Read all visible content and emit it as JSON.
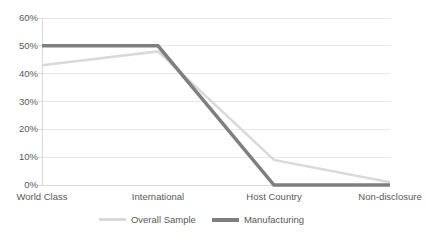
{
  "chart_data": {
    "type": "line",
    "title": "",
    "subtitle": "",
    "xlabel": "",
    "ylabel": "",
    "categories": [
      "World Class",
      "International",
      "Host Country",
      "Non-disclosure"
    ],
    "series": [
      {
        "name": "Overall Sample",
        "values": [
          43,
          48,
          9,
          1
        ],
        "color": "#D9D9D9",
        "line_width": 2.5
      },
      {
        "name": "Manufacturing",
        "values": [
          50,
          50,
          0,
          0
        ],
        "color": "#7F7F7F",
        "line_width": 3.5
      }
    ],
    "ylim": [
      0,
      60
    ],
    "ytick_values": [
      0,
      10,
      20,
      30,
      40,
      50,
      60
    ],
    "ytick_labels": [
      "0%",
      "10%",
      "20%",
      "30%",
      "40%",
      "50%",
      "60%"
    ],
    "grid": {
      "horizontal": true,
      "vertical": false,
      "color": "#E8E8E8"
    },
    "axis_line_color": "#D9D9D9",
    "legend": {
      "position": "bottom",
      "entries": [
        {
          "label": "Overall Sample",
          "color": "#D9D9D9"
        },
        {
          "label": "Manufacturing",
          "color": "#7F7F7F"
        }
      ]
    },
    "plot_area": {
      "left": 42,
      "right": 390,
      "top": 18,
      "bottom": 185
    },
    "background_color": "#FFFFFF",
    "text_color": "#595959"
  }
}
